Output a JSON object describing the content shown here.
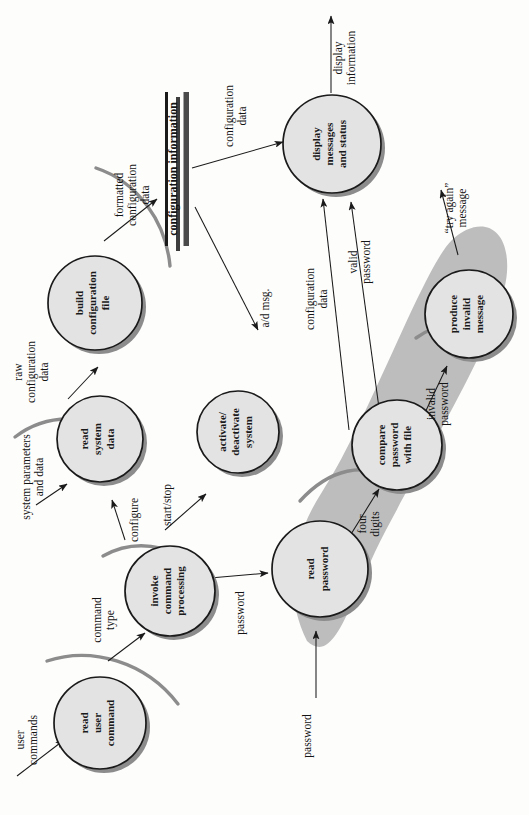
{
  "diagram": {
    "orientation": "rotated-90-ccw",
    "colors": {
      "process_fill": "#e3e3e3",
      "process_stroke": "#1a1a1a",
      "process_shadow": "#8c8c8c",
      "group_blob": "#b9b9b9",
      "arc": "#8c8c8c",
      "arrow": "#1a1a1a",
      "store_bar": "#4a4a4a",
      "page_bg": "#fdfdfc"
    },
    "processes": [
      {
        "id": "read-user-command",
        "lines": [
          "read",
          "user",
          "command"
        ]
      },
      {
        "id": "invoke-command-processing",
        "lines": [
          "invoke",
          "command",
          "processing"
        ]
      },
      {
        "id": "read-system-data",
        "lines": [
          "read",
          "system",
          "data"
        ]
      },
      {
        "id": "build-configuration-file",
        "lines": [
          "build",
          "configuration",
          "file"
        ]
      },
      {
        "id": "activate-deactivate-system",
        "lines": [
          "activate/",
          "deactivate",
          "system"
        ]
      },
      {
        "id": "read-password",
        "lines": [
          "read",
          "password"
        ]
      },
      {
        "id": "compare-password-with-file",
        "lines": [
          "compare",
          "password",
          "with file"
        ]
      },
      {
        "id": "produce-invalid-message",
        "lines": [
          "produce",
          "invalid",
          "message"
        ]
      },
      {
        "id": "display-messages-and-status",
        "lines": [
          "display",
          "messages",
          "and status"
        ]
      }
    ],
    "data_stores": [
      {
        "id": "configuration-information",
        "label": "configuration information"
      }
    ],
    "flows": [
      {
        "id": "user-commands",
        "lines": [
          "user",
          "commands"
        ]
      },
      {
        "id": "command-type",
        "lines": [
          "command",
          "type"
        ]
      },
      {
        "id": "configure",
        "lines": [
          "configure"
        ]
      },
      {
        "id": "start-stop",
        "lines": [
          "start/stop"
        ]
      },
      {
        "id": "password-invoke",
        "lines": [
          "password"
        ]
      },
      {
        "id": "password-external",
        "lines": [
          "password"
        ]
      },
      {
        "id": "system-parameters-and-data",
        "lines": [
          "system parameters",
          "and data"
        ]
      },
      {
        "id": "raw-configuration-data",
        "lines": [
          "raw",
          "configuration",
          "data"
        ]
      },
      {
        "id": "formatted-configuration-data",
        "lines": [
          "formatted",
          "configuration",
          "data"
        ]
      },
      {
        "id": "configuration-data-store-to-display",
        "lines": [
          "configuration",
          "data"
        ]
      },
      {
        "id": "configuration-data-to-display",
        "lines": [
          "configuration",
          "data"
        ]
      },
      {
        "id": "a-d-msg",
        "lines": [
          "a/d msg."
        ]
      },
      {
        "id": "four-digits",
        "lines": [
          "four",
          "digits"
        ]
      },
      {
        "id": "valid-password",
        "lines": [
          "valid",
          "password"
        ]
      },
      {
        "id": "invalid-password",
        "lines": [
          "invalid",
          "password"
        ]
      },
      {
        "id": "try-again-message",
        "lines": [
          "“try again”",
          "message"
        ]
      },
      {
        "id": "display-information",
        "lines": [
          "display",
          "information"
        ]
      }
    ]
  }
}
